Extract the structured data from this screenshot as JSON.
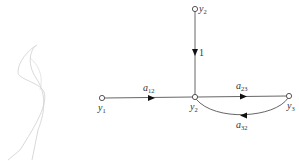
{
  "diagram": {
    "type": "signal-flow-graph",
    "nodes": [
      {
        "id": "y2_top",
        "label": "y",
        "sub": "2"
      },
      {
        "id": "y1",
        "label": "y",
        "sub": "1"
      },
      {
        "id": "y2",
        "label": "y",
        "sub": "2"
      },
      {
        "id": "y3",
        "label": "y",
        "sub": "3"
      }
    ],
    "edges": [
      {
        "from": "y2_top",
        "to": "y2",
        "label": "1",
        "sub": ""
      },
      {
        "from": "y1",
        "to": "y2",
        "label": "a",
        "sub": "12"
      },
      {
        "from": "y2",
        "to": "y3",
        "label": "a",
        "sub": "23"
      },
      {
        "from": "y3",
        "to": "y2",
        "label": "a",
        "sub": "32"
      }
    ],
    "colors": {
      "line": "#555555",
      "sketch": "#c8c8c8"
    }
  }
}
